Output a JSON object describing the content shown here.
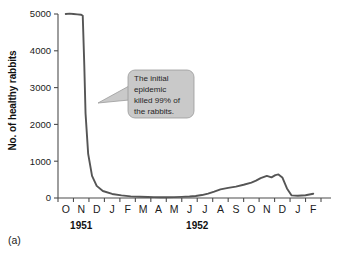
{
  "figure": {
    "panel_label": "(a)",
    "ylabel": "No. of healthy rabbits"
  },
  "annotation": {
    "lines": [
      "The initial",
      "epidemic",
      "killed 99% of",
      "the rabbits."
    ],
    "full_text": "The initial epidemic killed 99% of the rabbits.",
    "fill_color": "#c9c9c9",
    "border_color": "#9a9a9a",
    "text_color": "#262626"
  },
  "colors": {
    "curve": "#555555",
    "axis": "#4d4d4d",
    "background": "#ffffff"
  },
  "chart_data": {
    "type": "line",
    "title": "",
    "xlabel": "",
    "ylabel": "No. of healthy rabbits",
    "ylim": [
      0,
      5000
    ],
    "yticks": [
      0,
      1000,
      2000,
      3000,
      4000,
      5000
    ],
    "ytick_labels": [
      "0",
      "1000",
      "2000",
      "3000",
      "4000",
      "5000"
    ],
    "grid": false,
    "legend": "none",
    "categories": [
      "O",
      "N",
      "D",
      "J",
      "F",
      "M",
      "A",
      "M",
      "J",
      "J",
      "A",
      "S",
      "O",
      "N",
      "D",
      "J",
      "F"
    ],
    "group_labels": [
      {
        "label": "1951",
        "start_index": 0,
        "end_index": 2
      },
      {
        "label": "1952",
        "start_index": 3,
        "end_index": 14
      }
    ],
    "series": [
      {
        "name": "Healthy rabbits",
        "values": [
          5000,
          4980,
          60,
          25,
          20,
          20,
          25,
          40,
          100,
          230,
          310,
          390,
          520,
          600,
          70,
          60,
          110
        ]
      }
    ],
    "x_fractional": [
      0.0,
      0.25,
      0.5,
      0.75,
      1.0,
      1.1,
      1.2,
      1.28,
      1.45,
      1.7,
      2.0,
      2.4,
      3.0,
      3.6,
      4.2,
      4.8,
      5.3,
      5.7,
      6.1,
      6.5,
      7.0,
      7.5,
      8.0,
      8.4,
      8.8,
      9.2,
      9.6,
      10.0,
      10.5,
      11.0,
      11.5,
      12.0,
      12.3,
      12.6,
      13.0,
      13.3,
      13.55,
      13.75,
      14.0,
      14.3,
      14.6,
      15.0,
      15.5,
      16.0
    ],
    "y_fractional": [
      5000,
      5010,
      5000,
      4990,
      4980,
      4950,
      3600,
      2300,
      1200,
      600,
      330,
      190,
      110,
      70,
      45,
      35,
      28,
      25,
      22,
      22,
      24,
      30,
      40,
      55,
      80,
      120,
      175,
      235,
      275,
      310,
      360,
      420,
      470,
      540,
      600,
      560,
      620,
      640,
      560,
      260,
      70,
      60,
      75,
      115
    ]
  }
}
